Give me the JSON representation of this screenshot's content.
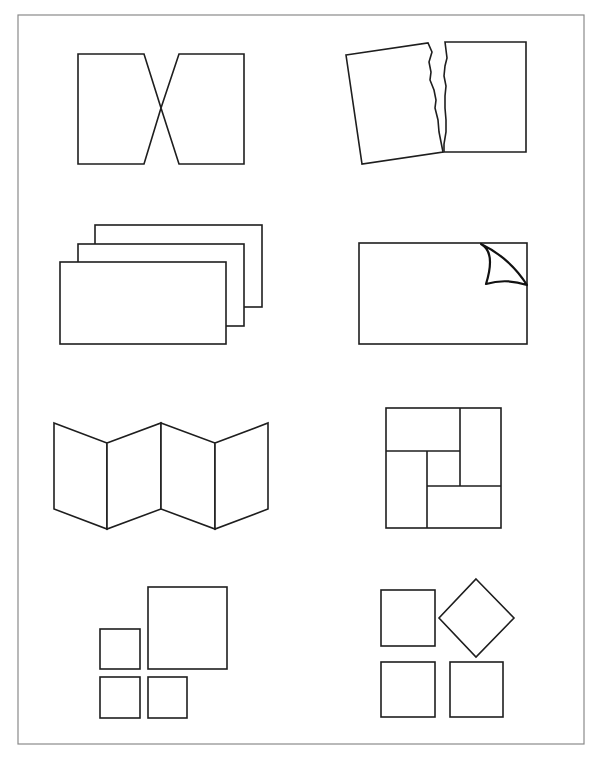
{
  "page": {
    "width": 604,
    "height": 758,
    "background": "#ffffff",
    "frame_color": "#8a8a8a",
    "line_color": "#1e1e1e"
  },
  "figures": [
    {
      "id": "bowtie-rectangles",
      "description": "Two rectangles whose inner edges taper to a shared crossing point"
    },
    {
      "id": "torn-paper",
      "description": "A sheet torn into two pieces with jagged edge, left piece tilted"
    },
    {
      "id": "stacked-cards",
      "description": "Three overlapping rectangles stacked diagonally"
    },
    {
      "id": "page-curl",
      "description": "Rectangle with the top-right corner peeling over"
    },
    {
      "id": "zigzag-folder",
      "description": "Four accordion-folded panels"
    },
    {
      "id": "pinwheel-square",
      "description": "Square divided into four rectangles around a small center square"
    },
    {
      "id": "squares-grouping",
      "description": "One large square with three small squares"
    },
    {
      "id": "squares-with-diamond",
      "description": "Three squares and one rotated square (diamond)"
    }
  ]
}
